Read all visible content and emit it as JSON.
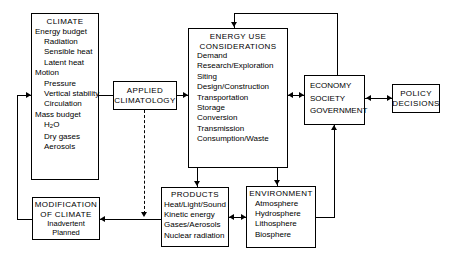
{
  "diagram": {
    "line_color": "#000000",
    "background": "#ffffff",
    "boxes": {
      "climate": {
        "title": "CLIMATE",
        "items": [
          "Energy budget",
          "Radiation",
          "Sensible heat",
          "Latent heat",
          "Motion",
          "Pressure",
          "Vertical stability",
          "Circulation",
          "Mass budget",
          "H2O",
          "Dry gases",
          "Aerosols"
        ]
      },
      "applied_climatology": {
        "title": "APPLIED\nCLIMATOLOGY"
      },
      "energy_use": {
        "title": "ENERGY USE\nCONSIDERATIONS",
        "items": [
          "Demand",
          "Research/Exploration",
          "Siting",
          "Design/Construction",
          "Transportation",
          "Storage",
          "Conversion",
          "Transmission",
          "Consumption/Waste"
        ]
      },
      "economy": {
        "items": [
          "ECONOMY",
          "SOCIETY",
          "GOVERNMENT"
        ]
      },
      "policy": {
        "title": "POLICY\nDECISIONS"
      },
      "products": {
        "title": "PRODUCTS",
        "items": [
          "Heat/Light/Sound",
          "Kinetic energy",
          "Gases/Aerosols",
          "Nuclear radiation"
        ]
      },
      "environment": {
        "title": "ENVIRONMENT",
        "items": [
          "Atmosphere",
          "Hydrosphere",
          "Lithosphere",
          "Biosphere"
        ]
      },
      "modification": {
        "title": "MODIFICATION\nOF CLIMATE",
        "items": [
          "Inadvertent",
          "Planned"
        ]
      }
    }
  }
}
